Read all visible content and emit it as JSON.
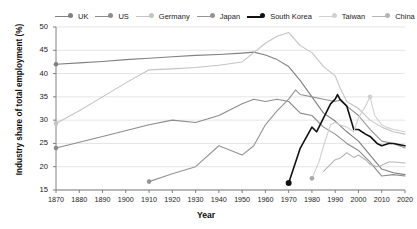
{
  "chart_data": {
    "type": "line",
    "title": "",
    "xlabel": "Year",
    "ylabel": "Industry share of total employment (%)",
    "xlim": [
      1870,
      2020
    ],
    "ylim": [
      15,
      50
    ],
    "xticks": [
      1870,
      1880,
      1890,
      1900,
      1910,
      1920,
      1930,
      1940,
      1950,
      1960,
      1970,
      1980,
      1990,
      2000,
      2010,
      2020
    ],
    "yticks": [
      15,
      20,
      25,
      30,
      35,
      40,
      45,
      50
    ],
    "grid": true,
    "legend_position": "top",
    "series": [
      {
        "name": "UK",
        "color": "#808080",
        "width": 1.1,
        "marker_at_start": true,
        "points": [
          [
            1870,
            42.0
          ],
          [
            1880,
            42.3
          ],
          [
            1890,
            42.6
          ],
          [
            1900,
            43.0
          ],
          [
            1910,
            43.3
          ],
          [
            1920,
            43.6
          ],
          [
            1930,
            43.9
          ],
          [
            1940,
            44.1
          ],
          [
            1950,
            44.4
          ],
          [
            1955,
            44.6
          ],
          [
            1960,
            44.0
          ],
          [
            1965,
            43.0
          ],
          [
            1970,
            41.5
          ],
          [
            1975,
            38.5
          ],
          [
            1980,
            35.0
          ],
          [
            1985,
            31.5
          ],
          [
            1990,
            29.8
          ],
          [
            1995,
            27.5
          ],
          [
            2000,
            25.5
          ],
          [
            2005,
            22.5
          ],
          [
            2010,
            19.5
          ],
          [
            2015,
            18.7
          ],
          [
            2020,
            18.3
          ]
        ]
      },
      {
        "name": "US",
        "color": "#8c8c8c",
        "width": 1.1,
        "marker_at_start": true,
        "points": [
          [
            1870,
            24.0
          ],
          [
            1890,
            26.5
          ],
          [
            1910,
            29.0
          ],
          [
            1920,
            30.0
          ],
          [
            1930,
            29.5
          ],
          [
            1940,
            31.0
          ],
          [
            1950,
            33.5
          ],
          [
            1955,
            34.5
          ],
          [
            1960,
            34.0
          ],
          [
            1965,
            34.5
          ],
          [
            1970,
            34.0
          ],
          [
            1975,
            31.5
          ],
          [
            1980,
            31.0
          ],
          [
            1985,
            28.5
          ],
          [
            1990,
            27.0
          ],
          [
            1995,
            25.0
          ],
          [
            2000,
            23.5
          ],
          [
            2005,
            21.0
          ],
          [
            2010,
            18.0
          ],
          [
            2015,
            18.3
          ],
          [
            2020,
            18.0
          ]
        ]
      },
      {
        "name": "Germany",
        "color": "#c4c4c4",
        "width": 1.1,
        "marker_at_start": true,
        "points": [
          [
            1870,
            29.3
          ],
          [
            1880,
            32.0
          ],
          [
            1890,
            35.0
          ],
          [
            1900,
            38.0
          ],
          [
            1910,
            40.8
          ],
          [
            1920,
            41.0
          ],
          [
            1930,
            41.3
          ],
          [
            1940,
            41.8
          ],
          [
            1950,
            42.5
          ],
          [
            1955,
            44.5
          ],
          [
            1960,
            46.5
          ],
          [
            1965,
            48.0
          ],
          [
            1970,
            48.8
          ],
          [
            1975,
            46.0
          ],
          [
            1980,
            44.5
          ],
          [
            1985,
            41.5
          ],
          [
            1990,
            39.5
          ],
          [
            1992,
            37.0
          ],
          [
            1995,
            34.0
          ],
          [
            2000,
            32.5
          ],
          [
            2005,
            30.0
          ],
          [
            2010,
            28.5
          ],
          [
            2015,
            27.5
          ],
          [
            2020,
            27.0
          ]
        ]
      },
      {
        "name": "Japan",
        "color": "#949494",
        "width": 1.1,
        "marker_at_start": true,
        "points": [
          [
            1910,
            16.8
          ],
          [
            1920,
            18.5
          ],
          [
            1930,
            20.0
          ],
          [
            1940,
            24.5
          ],
          [
            1950,
            22.5
          ],
          [
            1955,
            24.5
          ],
          [
            1960,
            29.0
          ],
          [
            1965,
            32.0
          ],
          [
            1970,
            34.5
          ],
          [
            1973,
            36.5
          ],
          [
            1975,
            35.5
          ],
          [
            1980,
            35.0
          ],
          [
            1985,
            34.5
          ],
          [
            1990,
            34.0
          ],
          [
            1992,
            34.3
          ],
          [
            1995,
            33.0
          ],
          [
            2000,
            31.0
          ],
          [
            2005,
            28.0
          ],
          [
            2010,
            25.5
          ],
          [
            2015,
            25.0
          ],
          [
            2020,
            24.0
          ]
        ]
      },
      {
        "name": "South Korea",
        "color": "#111111",
        "width": 1.6,
        "marker_at_start": true,
        "points": [
          [
            1970,
            16.5
          ],
          [
            1975,
            24.0
          ],
          [
            1980,
            28.5
          ],
          [
            1982,
            27.5
          ],
          [
            1985,
            30.5
          ],
          [
            1988,
            33.5
          ],
          [
            1990,
            34.5
          ],
          [
            1991,
            35.5
          ],
          [
            1992,
            34.5
          ],
          [
            1995,
            33.0
          ],
          [
            1998,
            28.0
          ],
          [
            2000,
            28.0
          ],
          [
            2003,
            27.0
          ],
          [
            2005,
            26.5
          ],
          [
            2008,
            25.0
          ],
          [
            2010,
            24.5
          ],
          [
            2013,
            25.0
          ],
          [
            2015,
            25.0
          ],
          [
            2020,
            24.5
          ]
        ]
      },
      {
        "name": "Taiwan",
        "color": "#d0d0d0",
        "width": 1.1,
        "marker_at_mid": true,
        "points": [
          [
            1980,
            17.5
          ],
          [
            1983,
            21.0
          ],
          [
            1985,
            24.5
          ],
          [
            1987,
            27.5
          ],
          [
            1988,
            29.0
          ],
          [
            1990,
            29.5
          ],
          [
            1992,
            29.0
          ],
          [
            1995,
            28.5
          ],
          [
            1998,
            27.5
          ],
          [
            2000,
            30.5
          ],
          [
            2003,
            33.0
          ],
          [
            2005,
            35.0
          ],
          [
            2007,
            31.0
          ],
          [
            2010,
            29.0
          ],
          [
            2012,
            28.5
          ],
          [
            2015,
            28.0
          ],
          [
            2020,
            27.5
          ]
        ]
      },
      {
        "name": "China",
        "color": "#b5b5b5",
        "width": 1.1,
        "marker_at_start": false,
        "points": [
          [
            1985,
            19.0
          ],
          [
            1990,
            21.5
          ],
          [
            1992,
            21.8
          ],
          [
            1995,
            23.0
          ],
          [
            1998,
            22.0
          ],
          [
            2000,
            22.5
          ],
          [
            2003,
            21.5
          ],
          [
            2005,
            20.5
          ],
          [
            2008,
            20.0
          ],
          [
            2010,
            20.3
          ],
          [
            2013,
            21.0
          ],
          [
            2015,
            21.0
          ],
          [
            2020,
            20.8
          ]
        ]
      }
    ]
  },
  "legend": {
    "items": [
      {
        "label": "UK"
      },
      {
        "label": "US"
      },
      {
        "label": "Germany"
      },
      {
        "label": "Japan"
      },
      {
        "label": "South Korea"
      },
      {
        "label": "Taiwan"
      },
      {
        "label": "China"
      }
    ]
  },
  "axes": {
    "y_title": "Industry share of total employment (%)",
    "x_title": "Year"
  }
}
